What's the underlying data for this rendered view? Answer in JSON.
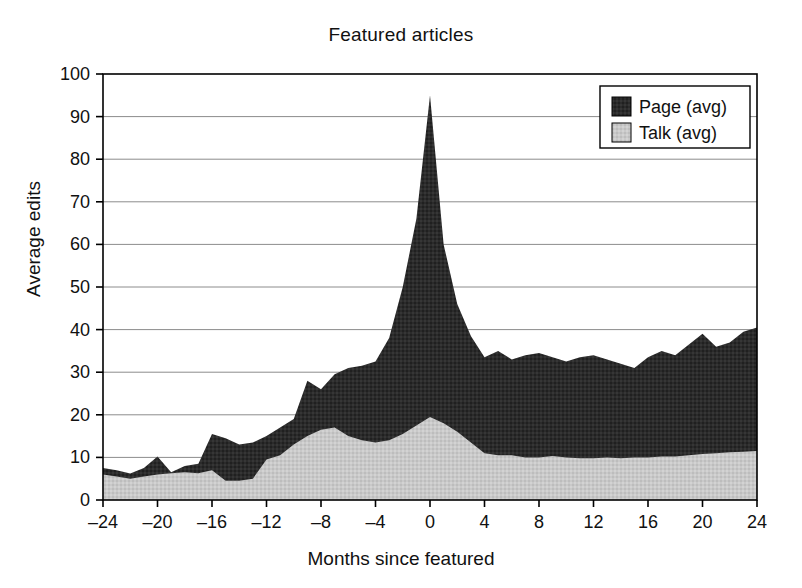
{
  "chart_data": {
    "type": "area",
    "title": "Featured articles",
    "xlabel": "Months since featured",
    "ylabel": "Average edits",
    "xlim": [
      -24,
      24
    ],
    "ylim": [
      0,
      100
    ],
    "xticks": [
      "–24",
      "–20",
      "–16",
      "–12",
      "–8",
      "–4",
      "0",
      "4",
      "8",
      "12",
      "16",
      "20",
      "24"
    ],
    "xtick_values": [
      -24,
      -20,
      -16,
      -12,
      -8,
      -4,
      0,
      4,
      8,
      12,
      16,
      20,
      24
    ],
    "yticks": [
      "0",
      "10",
      "20",
      "30",
      "40",
      "50",
      "60",
      "70",
      "80",
      "90",
      "100"
    ],
    "ytick_values": [
      0,
      10,
      20,
      30,
      40,
      50,
      60,
      70,
      80,
      90,
      100
    ],
    "grid": "horizontal",
    "stacked": true,
    "legend_position": "top-right",
    "colors": {
      "page": "#2b2b2b",
      "talk": "#c9c9c9",
      "axis": "#000000",
      "grid": "#8c8c8c"
    },
    "x": [
      -24,
      -23,
      -22,
      -21,
      -20,
      -19,
      -18,
      -17,
      -16,
      -15,
      -14,
      -13,
      -12,
      -11,
      -10,
      -9,
      -8,
      -7,
      -6,
      -5,
      -4,
      -3,
      -2,
      -1,
      0,
      1,
      2,
      3,
      4,
      5,
      6,
      7,
      8,
      9,
      10,
      11,
      12,
      13,
      14,
      15,
      16,
      17,
      18,
      19,
      20,
      21,
      22,
      23,
      24
    ],
    "series": [
      {
        "name": "Talk (avg)",
        "key": "talk",
        "swatch": "#c9c9c9",
        "values": [
          6.0,
          5.5,
          5.0,
          5.5,
          6.0,
          6.3,
          6.5,
          6.3,
          7.0,
          4.5,
          4.5,
          5.0,
          9.5,
          10.5,
          13.0,
          15.0,
          16.5,
          17.0,
          15.0,
          14.0,
          13.5,
          14.0,
          15.5,
          17.5,
          19.5,
          18.0,
          16.0,
          13.5,
          11.0,
          10.5,
          10.5,
          10.0,
          10.0,
          10.3,
          10.0,
          9.8,
          9.8,
          10.0,
          9.8,
          10.0,
          10.0,
          10.2,
          10.2,
          10.5,
          10.8,
          11.0,
          11.2,
          11.3,
          11.5
        ]
      },
      {
        "name": "Page (avg)",
        "key": "page",
        "swatch": "#2b2b2b",
        "values": [
          7.5,
          7.0,
          6.2,
          7.5,
          10.2,
          6.5,
          8.0,
          8.5,
          15.5,
          14.5,
          13.0,
          13.5,
          15.0,
          17.0,
          19.0,
          28.0,
          26.0,
          29.5,
          31.0,
          31.5,
          32.5,
          38.0,
          50.0,
          66.0,
          95.0,
          60.0,
          46.0,
          38.5,
          33.5,
          35.0,
          33.0,
          34.0,
          34.5,
          33.5,
          32.5,
          33.5,
          34.0,
          33.0,
          32.0,
          31.0,
          33.5,
          35.0,
          34.0,
          36.5,
          39.0,
          36.0,
          37.0,
          39.5,
          40.5
        ]
      }
    ],
    "legend_items": [
      {
        "label": "Page (avg)",
        "color": "#2b2b2b"
      },
      {
        "label": "Talk (avg)",
        "color": "#c9c9c9"
      }
    ]
  }
}
